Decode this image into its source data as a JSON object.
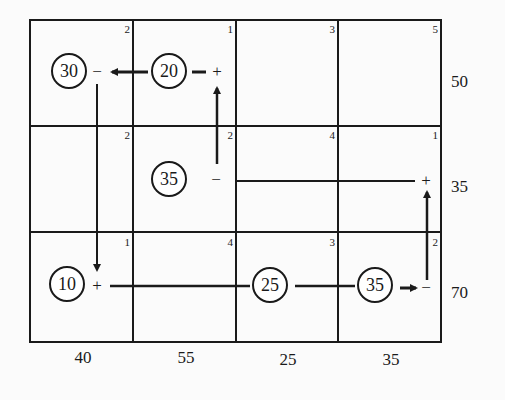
{
  "table": {
    "costs": [
      [
        "2",
        "1",
        "3",
        "5"
      ],
      [
        "2",
        "2",
        "4",
        "1"
      ],
      [
        "1",
        "4",
        "3",
        "2"
      ]
    ],
    "supply": [
      "50",
      "35",
      "70"
    ],
    "demand": [
      "40",
      "55",
      "25",
      "35"
    ]
  },
  "allocations": [
    {
      "value": "30",
      "row": 0,
      "col": 0
    },
    {
      "value": "20",
      "row": 0,
      "col": 1
    },
    {
      "value": "35",
      "row": 1,
      "col": 1
    },
    {
      "value": "10",
      "row": 2,
      "col": 0
    },
    {
      "value": "25",
      "row": 2,
      "col": 2
    },
    {
      "value": "35",
      "row": 2,
      "col": 3
    }
  ],
  "path_signs": [
    {
      "sign": "−",
      "row": 0,
      "col": 0
    },
    {
      "sign": "+",
      "row": 0,
      "col": 1
    },
    {
      "sign": "−",
      "row": 1,
      "col": 1
    },
    {
      "sign": "+",
      "row": 1,
      "col": 3
    },
    {
      "sign": "+",
      "row": 2,
      "col": 0
    },
    {
      "sign": "−",
      "row": 2,
      "col": 3
    }
  ],
  "colors": {
    "line": "#1a1a1a",
    "background": "#fbfbfb"
  }
}
